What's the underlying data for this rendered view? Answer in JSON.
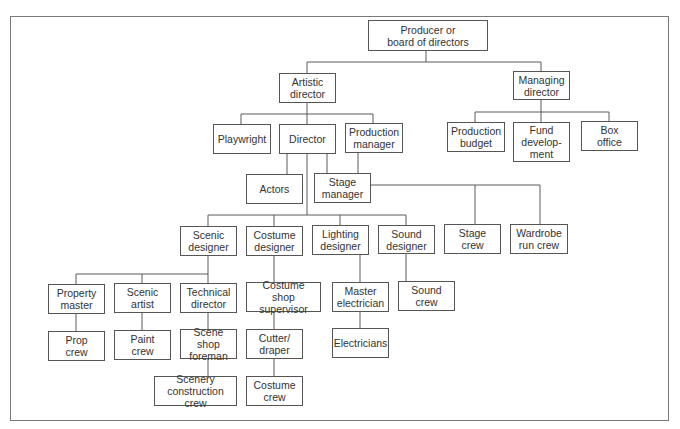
{
  "diagram": {
    "type": "org-chart",
    "nodes": {
      "producer": "Producer or\nboard of directors",
      "artistic_director": "Artistic\ndirector",
      "managing_director": "Managing\ndirector",
      "playwright": "Playwright",
      "director": "Director",
      "production_manager": "Production\nmanager",
      "production_budget": "Production\nbudget",
      "fund_development": "Fund\ndevelop-\nment",
      "box_office": "Box\noffice",
      "actors": "Actors",
      "stage_manager": "Stage\nmanager",
      "scenic_designer": "Scenic\ndesigner",
      "costume_designer": "Costume\ndesigner",
      "lighting_designer": "Lighting\ndesigner",
      "sound_designer": "Sound\ndesigner",
      "stage_crew": "Stage\ncrew",
      "wardrobe_run_crew": "Wardrobe\nrun crew",
      "property_master": "Property\nmaster",
      "scenic_artist": "Scenic\nartist",
      "technical_director": "Technical\ndirector",
      "costume_shop_supervisor": "Costume\nshop supervisor",
      "master_electrician": "Master\nelectrician",
      "sound_crew": "Sound\ncrew",
      "prop_crew": "Prop\ncrew",
      "paint_crew": "Paint\ncrew",
      "scene_shop_foreman": "Scene shop\nforeman",
      "cutter_draper": "Cutter/\ndraper",
      "electricians": "Electricians",
      "scenery_construction_crew": "Scenery\nconstruction crew",
      "costume_crew": "Costume\ncrew"
    },
    "edges": [
      [
        "producer",
        "artistic_director"
      ],
      [
        "producer",
        "managing_director"
      ],
      [
        "artistic_director",
        "playwright"
      ],
      [
        "artistic_director",
        "director"
      ],
      [
        "artistic_director",
        "production_manager"
      ],
      [
        "managing_director",
        "production_budget"
      ],
      [
        "managing_director",
        "fund_development"
      ],
      [
        "managing_director",
        "box_office"
      ],
      [
        "director",
        "actors"
      ],
      [
        "director",
        "stage_manager"
      ],
      [
        "production_manager",
        "stage_manager"
      ],
      [
        "director",
        "scenic_designer"
      ],
      [
        "director",
        "costume_designer"
      ],
      [
        "director",
        "lighting_designer"
      ],
      [
        "director",
        "sound_designer"
      ],
      [
        "stage_manager",
        "stage_crew"
      ],
      [
        "stage_manager",
        "wardrobe_run_crew"
      ],
      [
        "scenic_designer",
        "property_master"
      ],
      [
        "scenic_designer",
        "scenic_artist"
      ],
      [
        "scenic_designer",
        "technical_director"
      ],
      [
        "costume_designer",
        "costume_shop_supervisor"
      ],
      [
        "lighting_designer",
        "master_electrician"
      ],
      [
        "sound_designer",
        "sound_crew"
      ],
      [
        "property_master",
        "prop_crew"
      ],
      [
        "scenic_artist",
        "paint_crew"
      ],
      [
        "technical_director",
        "scene_shop_foreman"
      ],
      [
        "costume_shop_supervisor",
        "cutter_draper"
      ],
      [
        "master_electrician",
        "electricians"
      ],
      [
        "scene_shop_foreman",
        "scenery_construction_crew"
      ],
      [
        "cutter_draper",
        "costume_crew"
      ]
    ]
  }
}
